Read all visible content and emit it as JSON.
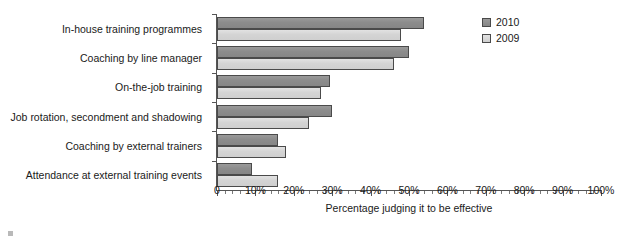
{
  "chart_data": {
    "type": "bar",
    "orientation": "horizontal",
    "title": "",
    "xlabel": "Percentage judging it to be effective",
    "ylabel": "",
    "xlim": [
      0,
      100
    ],
    "xticks": [
      0,
      10,
      20,
      30,
      40,
      50,
      60,
      70,
      80,
      90,
      100
    ],
    "xtick_labels": [
      "0",
      "10%",
      "20%",
      "30%",
      "40%",
      "50%",
      "60%",
      "70%",
      "80%",
      "90%",
      "100%"
    ],
    "minor_ticks": true,
    "grid": false,
    "legend_position": "top-right",
    "categories": [
      "In-house training programmes",
      "Coaching by line manager",
      "On-the-job training",
      "Job rotation, secondment and shadowing",
      "Coaching by external trainers",
      "Attendance at external training events"
    ],
    "series": [
      {
        "name": "2010",
        "color": "#8c8c8c",
        "values": [
          54,
          50,
          29.5,
          30,
          16,
          9
        ]
      },
      {
        "name": "2009",
        "color": "#d4d4d4",
        "values": [
          48,
          46,
          27,
          24,
          18,
          16
        ]
      }
    ]
  },
  "legend": {
    "items": [
      {
        "label": "2010",
        "key": "s2010"
      },
      {
        "label": "2009",
        "key": "s2009"
      }
    ]
  }
}
